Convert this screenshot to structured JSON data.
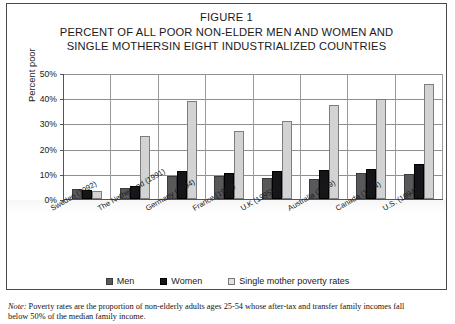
{
  "figure": {
    "number_label": "FIGURE 1",
    "title_line_1": "PERCENT OF ALL POOR NON-ELDER MEN AND WOMEN AND",
    "title_line_2": "SINGLE MOTHERSIN EIGHT INDUSTRIALIZED COUNTRIES"
  },
  "note": {
    "prefix": "Note:",
    "line_1": "Poverty rates are the proportion of non-elderly adults ages 25-54 whose after-tax and transfer family incomes fall",
    "line_2": "below 50% of the median family income."
  },
  "legend": {
    "items": [
      {
        "label": "Men",
        "color": "#59595b",
        "key": "men"
      },
      {
        "label": "Women",
        "color": "#16161a",
        "key": "women"
      },
      {
        "label": "Single mother poverty rates",
        "color": "#e2e2e2",
        "key": "single"
      }
    ]
  },
  "axes": {
    "y_title": "Percent poor",
    "y_ticks": [
      "0%",
      "10%",
      "20%",
      "30%",
      "40%",
      "50%"
    ]
  },
  "chart_data": {
    "type": "bar",
    "title": "PERCENT OF ALL POOR NON-ELDER MEN AND WOMEN AND SINGLE MOTHERSIN EIGHT INDUSTRIALIZED COUNTRIES",
    "xlabel": "",
    "ylabel": "Percent poor",
    "ylim": [
      0,
      50
    ],
    "ytick_values": [
      0,
      10,
      20,
      30,
      40,
      50
    ],
    "ytick_labels": [
      "0%",
      "10%",
      "20%",
      "30%",
      "40%",
      "50%"
    ],
    "grid": true,
    "legend_position": "bottom",
    "categories": [
      "Sweden (1992)",
      "The Netherland (1991)",
      "Germany (1994)",
      "France (1989)",
      "U.K (1995)",
      "Australia (1989)",
      "Canada (1994)",
      "U.S. (1994)"
    ],
    "series": [
      {
        "name": "Men",
        "color": "#59595b",
        "values": [
          4.0,
          4.2,
          9.0,
          9.0,
          8.5,
          8.0,
          10.5,
          10.0
        ]
      },
      {
        "name": "Women",
        "color": "#16161a",
        "values": [
          3.5,
          5.2,
          11.0,
          10.5,
          11.0,
          11.5,
          12.0,
          14.0
        ]
      },
      {
        "name": "Single mother poverty rates",
        "color": "#d3d3d3",
        "values": [
          3.0,
          25.0,
          39.0,
          27.0,
          31.0,
          37.5,
          39.5,
          45.5
        ]
      }
    ]
  }
}
